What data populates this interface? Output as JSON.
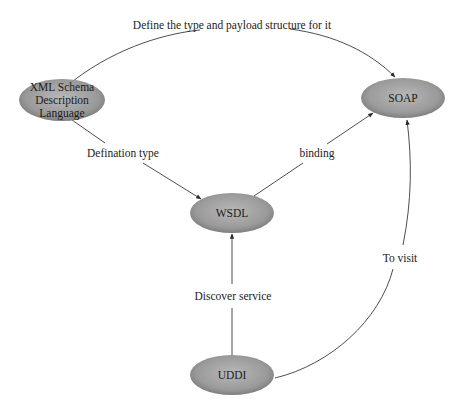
{
  "diagram": {
    "nodes": [
      {
        "id": "xml",
        "label_lines": [
          "XML Schema",
          "Description",
          "Language"
        ],
        "cx": 62,
        "cy": 100,
        "rx": 43,
        "ry": 21
      },
      {
        "id": "soap",
        "label_lines": [
          "SOAP"
        ],
        "cx": 403,
        "cy": 98,
        "rx": 42,
        "ry": 20
      },
      {
        "id": "wsdl",
        "label_lines": [
          "WSDL"
        ],
        "cx": 232,
        "cy": 213,
        "rx": 42,
        "ry": 20
      },
      {
        "id": "uddi",
        "label_lines": [
          "UDDI"
        ],
        "cx": 232,
        "cy": 375,
        "rx": 42,
        "ry": 20
      }
    ],
    "edges": [
      {
        "from": "xml",
        "to": "soap",
        "label": "Define the type and payload structure for it"
      },
      {
        "from": "xml",
        "to": "wsdl",
        "label": "Defination type"
      },
      {
        "from": "wsdl",
        "to": "soap",
        "label": "binding"
      },
      {
        "from": "uddi",
        "to": "wsdl",
        "label": "Discover service"
      },
      {
        "from": "uddi",
        "to": "soap",
        "label": "To visit"
      }
    ],
    "colors": {
      "node_fill_center": "#b4b4b4",
      "node_fill_edge": "#7a7a7a",
      "edge_stroke": "#3a3a3a",
      "background": "#ffffff"
    }
  },
  "labels": {
    "xml": {
      "line1": "XML Schema",
      "line2": "Description",
      "line3": "Language"
    },
    "soap": "SOAP",
    "wsdl": "WSDL",
    "uddi": "UDDI",
    "edge_define": "Define the type and payload structure for it",
    "edge_defination": "Defination type",
    "edge_binding": "binding",
    "edge_discover": "Discover service",
    "edge_visit": "To visit"
  }
}
